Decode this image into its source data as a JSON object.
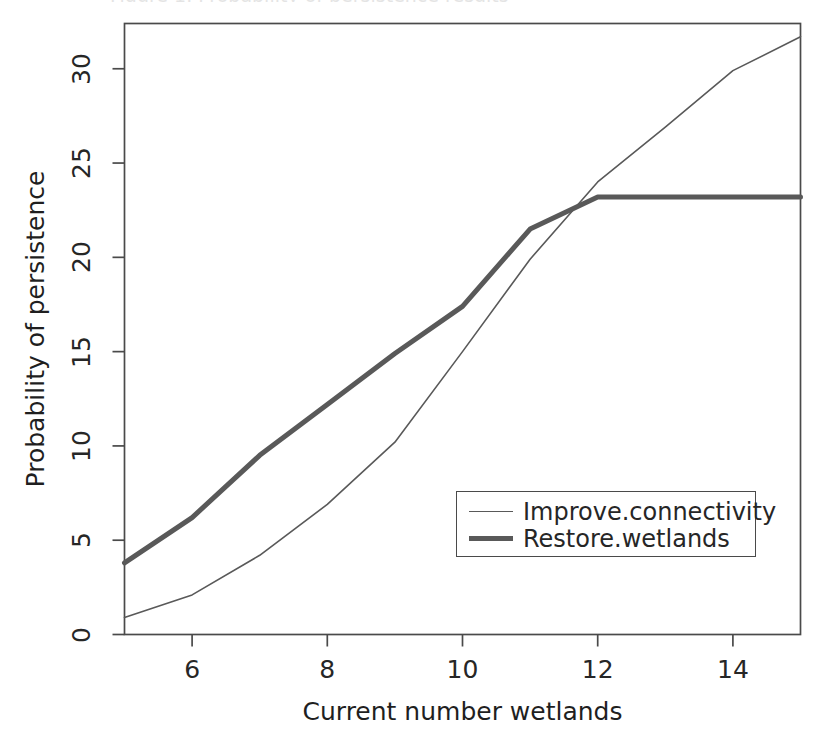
{
  "figure": {
    "clipped_top_caption": "Figure 1. Probability of persistence results",
    "background_color": "#ffffff",
    "frame_color": "#4a4a4a"
  },
  "legend": {
    "position": "inside-lower-right",
    "border_color": "#4a4a4a",
    "entries": [
      {
        "label": "Improve.connectivity",
        "style": "thin",
        "color": "#595959"
      },
      {
        "label": "Restore.wetlands",
        "style": "thick",
        "color": "#595959"
      }
    ]
  },
  "chart_data": {
    "type": "line",
    "title": "",
    "subtitle": "",
    "xlabel": "Current number wetlands",
    "ylabel": "Probability of persistence",
    "xlim": [
      5,
      15
    ],
    "ylim": [
      0,
      32.4
    ],
    "grid": false,
    "xticks": [
      6,
      8,
      10,
      12,
      14
    ],
    "yticks": [
      0,
      5,
      10,
      15,
      20,
      25,
      30
    ],
    "xtick_labels": [
      "6",
      "8",
      "10",
      "12",
      "14"
    ],
    "ytick_labels": [
      "0",
      "5",
      "10",
      "15",
      "20",
      "25",
      "30"
    ],
    "x": [
      5,
      6,
      7,
      8,
      9,
      10,
      11,
      12,
      13,
      14,
      15
    ],
    "series": [
      {
        "name": "Improve.connectivity",
        "color": "#595959",
        "linewidth": 1.6,
        "values": [
          0.9,
          2.1,
          4.2,
          6.9,
          10.2,
          15.0,
          19.9,
          24.0,
          26.9,
          29.9,
          31.7
        ]
      },
      {
        "name": "Restore.wetlands",
        "color": "#595959",
        "linewidth": 5.0,
        "values": [
          3.8,
          6.2,
          9.5,
          12.2,
          14.9,
          17.4,
          21.5,
          23.2,
          23.2,
          23.2,
          23.2
        ]
      }
    ],
    "annotations": []
  }
}
